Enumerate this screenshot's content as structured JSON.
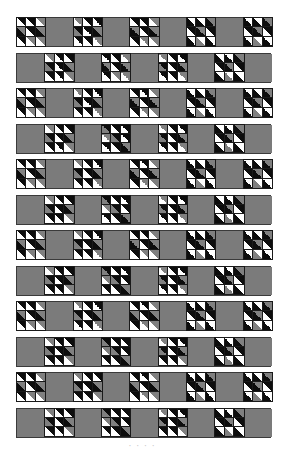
{
  "figure": {
    "rows": 12,
    "blocks_per_row": 9,
    "colors": {
      "plain": "#7b7b7b",
      "black": "#0d0d0d",
      "dark": "#2a2a2a",
      "gray": "#808080",
      "light": "#e6e6e6",
      "white": "#ffffff",
      "border": "#3a3a3a"
    },
    "block_variants": {
      "A": [
        [
          "black",
          "white"
        ],
        [
          "black",
          "white"
        ],
        [
          "gray",
          "white"
        ],
        [
          "gray",
          "black"
        ],
        [
          "black",
          "white"
        ],
        [
          "gray",
          "black"
        ],
        [
          "black",
          "white"
        ],
        [
          "gray",
          "white"
        ],
        [
          "gray",
          "white"
        ]
      ],
      "B": [
        [
          "gray",
          "white"
        ],
        [
          "black",
          "white"
        ],
        [
          "black",
          "white"
        ],
        [
          "black",
          "gray"
        ],
        [
          "black",
          "white"
        ],
        [
          "gray",
          "black"
        ],
        [
          "black",
          "white"
        ],
        [
          "black",
          "white"
        ],
        [
          "gray",
          "white"
        ]
      ],
      "C": [
        [
          "white",
          "black"
        ],
        [
          "white",
          "black"
        ],
        [
          "gray",
          "black"
        ],
        [
          "black",
          "white"
        ],
        [
          "gray",
          "black"
        ],
        [
          "black",
          "white"
        ],
        [
          "white",
          "black"
        ],
        [
          "white",
          "gray"
        ],
        [
          "white",
          "black"
        ]
      ],
      "D": [
        [
          "black",
          "gray"
        ],
        [
          "black",
          "white"
        ],
        [
          "black",
          "white"
        ],
        [
          "gray",
          "white"
        ],
        [
          "black",
          "gray"
        ],
        [
          "black",
          "white"
        ],
        [
          "black",
          "white"
        ],
        [
          "black",
          "white"
        ],
        [
          "gray",
          "black"
        ]
      ]
    },
    "row_layouts": [
      [
        "A",
        "plain",
        "B",
        "plain",
        "A",
        "plain",
        "C",
        "plain",
        "C"
      ],
      [
        "plain",
        "B",
        "plain",
        "A",
        "plain",
        "B",
        "plain",
        "C",
        "plain"
      ],
      [
        "A",
        "plain",
        "B",
        "plain",
        "A",
        "plain",
        "C",
        "plain",
        "C"
      ],
      [
        "plain",
        "B",
        "plain",
        "D",
        "plain",
        "B",
        "plain",
        "C",
        "plain"
      ],
      [
        "A",
        "plain",
        "B",
        "plain",
        "A",
        "plain",
        "C",
        "plain",
        "C"
      ],
      [
        "plain",
        "B",
        "plain",
        "D",
        "plain",
        "B",
        "plain",
        "C",
        "plain"
      ],
      [
        "A",
        "plain",
        "B",
        "plain",
        "A",
        "plain",
        "C",
        "plain",
        "C"
      ],
      [
        "plain",
        "B",
        "plain",
        "D",
        "plain",
        "B",
        "plain",
        "C",
        "plain"
      ],
      [
        "A",
        "plain",
        "B",
        "plain",
        "A",
        "plain",
        "C",
        "plain",
        "C"
      ],
      [
        "plain",
        "B",
        "plain",
        "D",
        "plain",
        "B",
        "plain",
        "C",
        "plain"
      ],
      [
        "A",
        "plain",
        "B",
        "plain",
        "A",
        "plain",
        "C",
        "plain",
        "C"
      ],
      [
        "plain",
        "B",
        "plain",
        "D",
        "plain",
        "B",
        "plain",
        "C",
        "plain"
      ]
    ],
    "row_top_px": 17,
    "row_pitch_px": 35.5,
    "caption": "· · · ·"
  }
}
